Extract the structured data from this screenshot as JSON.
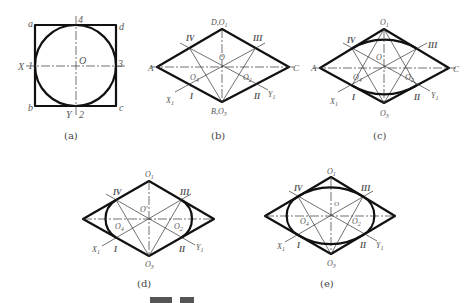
{
  "figure": {
    "panels": [
      {
        "id": "a",
        "caption": "(a)",
        "labels": {
          "a": "a",
          "b": "b",
          "c": "c",
          "d": "d",
          "x": "X",
          "y": "Y",
          "p1": "1",
          "p2": "2",
          "p3": "3",
          "p4": "4",
          "o": "O"
        }
      },
      {
        "id": "b",
        "caption": "(b)",
        "labels": {
          "A": "A",
          "C": "C",
          "top": "D,O",
          "top_sub": "1",
          "bottom": "B,O",
          "bottom_sub": "3",
          "center": "O",
          "O4": "O",
          "O4_sub": "4",
          "O2": "O",
          "O2_sub": "2",
          "X1": "X",
          "X1_sub": "1",
          "Y1": "Y",
          "Y1_sub": "1",
          "I": "I",
          "II": "II",
          "III": "III",
          "IV": "IV"
        }
      },
      {
        "id": "c",
        "caption": "(c)",
        "labels": {
          "A": "A",
          "C": "C",
          "top": "O",
          "top_sub": "1",
          "bottom": "O",
          "bottom_sub": "3",
          "center": "O",
          "O4": "O",
          "O4_sub": "4",
          "O2": "O",
          "O2_sub": "2",
          "X1": "X",
          "X1_sub": "1",
          "Y1": "Y",
          "Y1_sub": "1",
          "I": "I",
          "II": "II",
          "III": "III",
          "IV": "IV"
        }
      },
      {
        "id": "d",
        "caption": "(d)",
        "labels": {
          "top": "O",
          "top_sub": "1",
          "bottom": "O",
          "bottom_sub": "3",
          "center": "O'",
          "O4": "O",
          "O4_sub": "4",
          "O2": "O",
          "O2_sub": "2",
          "X1": "X",
          "X1_sub": "1",
          "Y1": "Y",
          "Y1_sub": "1",
          "I": "I",
          "II": "II",
          "III": "III",
          "IV": "IV"
        }
      },
      {
        "id": "e",
        "caption": "(e)",
        "labels": {
          "top": "O",
          "top_sub": "1",
          "bottom": "O",
          "bottom_sub": "3",
          "center": "O",
          "O4": "O",
          "O4_sub": "4",
          "O2": "O",
          "O2_sub": "2",
          "X1": "X",
          "X1_sub": "1",
          "Y1": "Y",
          "Y1_sub": "1",
          "I": "I",
          "II": "II",
          "III": "III",
          "IV": "IV"
        }
      }
    ],
    "bottom_caption_clipped": true
  }
}
